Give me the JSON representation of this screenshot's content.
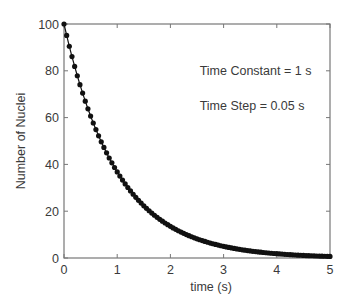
{
  "chart_data": {
    "type": "scatter",
    "title": "",
    "xlabel": "time (s)",
    "ylabel": "Number of Nuclei",
    "xlim": [
      0,
      5
    ],
    "ylim": [
      0,
      100
    ],
    "xticks": [
      0,
      1,
      2,
      3,
      4,
      5
    ],
    "yticks": [
      0,
      20,
      40,
      60,
      80,
      100
    ],
    "grid": false,
    "legend": null,
    "annotations": [
      {
        "text": "Time Constant = 1 s",
        "x": 2.55,
        "y": 80
      },
      {
        "text": "Time Step = 0.05 s",
        "x": 2.55,
        "y": 65
      }
    ],
    "series": [
      {
        "name": "N(t) = 100·exp(-t/1)",
        "style": "line-with-dot-markers",
        "color": "#111111",
        "time_constant": 1,
        "time_step": 0.05,
        "initial": 100,
        "x_start": 0,
        "x_end": 5,
        "points_note": "101 samples, N = 100*exp(-t), t = 0, 0.05, ..., 5"
      }
    ]
  },
  "labels": {
    "xlabel": "time (s)",
    "ylabel": "Number of Nuclei",
    "annotation_1": "Time Constant = 1 s",
    "annotation_2": "Time Step = 0.05 s"
  },
  "colors": {
    "axis": "#777777",
    "data": "#111111",
    "text": "#3a3a3a"
  }
}
